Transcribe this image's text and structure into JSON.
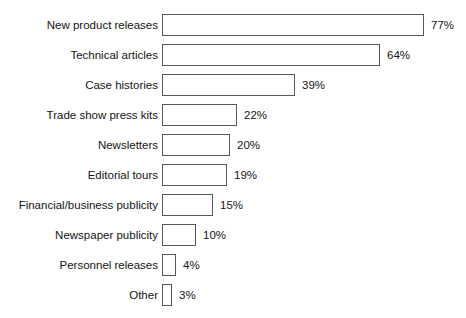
{
  "caption": "",
  "chart_data": {
    "type": "bar",
    "orientation": "horizontal",
    "title": "",
    "xlabel": "",
    "ylabel": "",
    "xlim": [
      0,
      80
    ],
    "grid": false,
    "legend": null,
    "value_suffix": "%",
    "categories": [
      "New product releases",
      "Technical articles",
      "Case histories",
      "Trade show press kits",
      "Newsletters",
      "Editorial tours",
      "Financial/business publicity",
      "Newspaper publicity",
      "Personnel releases",
      "Other"
    ],
    "values": [
      77,
      64,
      39,
      22,
      20,
      19,
      15,
      10,
      4,
      3
    ],
    "value_labels": [
      "77%",
      "64%",
      "39%",
      "22%",
      "20%",
      "19%",
      "15%",
      "10%",
      "4%",
      "3%"
    ],
    "bar_fill": "#ffffff",
    "bar_stroke": "#58585c",
    "background": "#ffffff",
    "text_color": "#141414"
  }
}
